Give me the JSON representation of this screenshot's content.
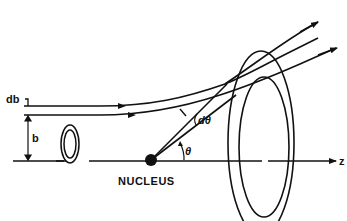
{
  "diagram": {
    "type": "scattering-geometry",
    "labels": {
      "db": "db",
      "b": "b",
      "nucleus": "NUCLEUS",
      "theta": "θ",
      "dtheta": "dθ",
      "axis": "z"
    },
    "colors": {
      "stroke": "#111111",
      "background": "#ffffff"
    }
  }
}
